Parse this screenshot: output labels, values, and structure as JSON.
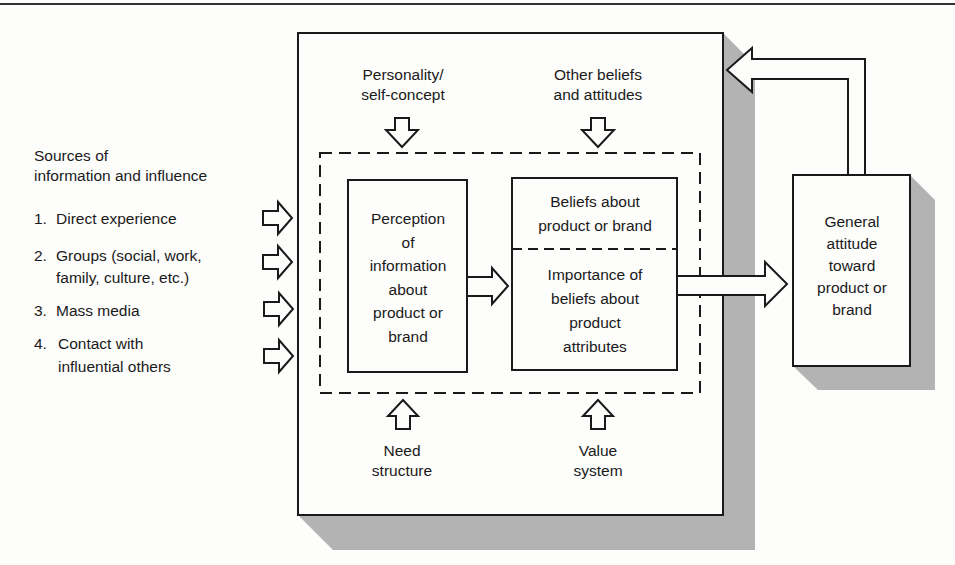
{
  "diagram": {
    "sources": {
      "title_line1": "Sources of",
      "title_line2": "information and influence",
      "items": [
        {
          "num": "1.",
          "line1": "Direct experience",
          "line2": ""
        },
        {
          "num": "2.",
          "line1": "Groups (social, work,",
          "line2": "family, culture, etc.)"
        },
        {
          "num": "3.",
          "line1": "Mass media",
          "line2": ""
        },
        {
          "num": "4.",
          "line1": "Contact with",
          "line2": "influential others"
        }
      ]
    },
    "top_influences": [
      {
        "line1": "Personality/",
        "line2": "self-concept"
      },
      {
        "line1": "Other beliefs",
        "line2": "and attitudes"
      }
    ],
    "bottom_influences": [
      {
        "line1": "Need",
        "line2": "structure"
      },
      {
        "line1": "Value",
        "line2": "system"
      }
    ],
    "perception_box": {
      "lines": [
        "Perception",
        "of",
        "information",
        "about",
        "product or",
        "brand"
      ]
    },
    "beliefs_box": {
      "top_lines": [
        "Beliefs about",
        "product or brand"
      ],
      "bottom_lines": [
        "Importance of",
        "beliefs about",
        "product",
        "attributes"
      ]
    },
    "attitude_box": {
      "lines": [
        "General",
        "attitude",
        "toward",
        "product or",
        "brand"
      ]
    },
    "colors": {
      "ink": "#1a1a1a",
      "shadow": "#b3b3b3",
      "paper": "#fdfdfb"
    }
  }
}
